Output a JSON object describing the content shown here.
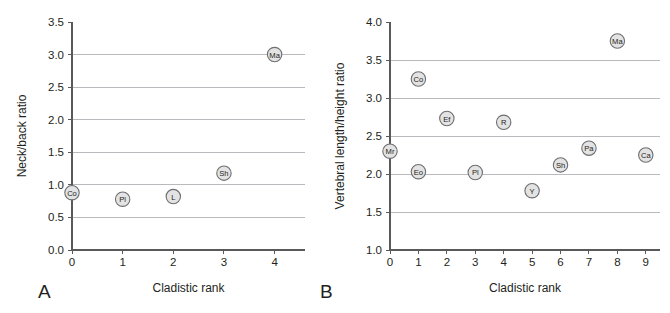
{
  "figure": {
    "background_color": "#ffffff",
    "marker_fill": "#e3e3e3",
    "marker_stroke": "#6d6e71",
    "grid_color": "#a7a9ac",
    "axis_color": "#58595b"
  },
  "panels": [
    {
      "id": "A",
      "label": "A",
      "chart_data": {
        "type": "scatter",
        "title": "",
        "xlabel": "Cladistic rank",
        "ylabel": "Neck/back ratio",
        "xlim": [
          0,
          4.6
        ],
        "ylim": [
          0.0,
          3.5
        ],
        "xticks": [
          "0",
          "1",
          "2",
          "3",
          "4"
        ],
        "xtick_values": [
          0,
          1,
          2,
          3,
          4
        ],
        "yticks": [
          "0.0",
          "0.5",
          "1.0",
          "1.5",
          "2.0",
          "2.5",
          "3.0",
          "3.5"
        ],
        "ytick_values": [
          0.0,
          0.5,
          1.0,
          1.5,
          2.0,
          2.5,
          3.0,
          3.5
        ],
        "grid": true,
        "gridlines_y": [
          0.5,
          1.0,
          1.5,
          2.0,
          2.5,
          3.0
        ],
        "legend": "none",
        "points": [
          {
            "label": "Co",
            "x": 0,
            "y": 0.88
          },
          {
            "label": "Pl",
            "x": 1,
            "y": 0.78
          },
          {
            "label": "L",
            "x": 2,
            "y": 0.82
          },
          {
            "label": "Sh",
            "x": 3,
            "y": 1.18
          },
          {
            "label": "Ma",
            "x": 4,
            "y": 3.0
          }
        ]
      }
    },
    {
      "id": "B",
      "label": "B",
      "chart_data": {
        "type": "scatter",
        "title": "",
        "xlabel": "Cladistic rank",
        "ylabel": "Vertebral length/height ratio",
        "xlim": [
          0,
          9.5
        ],
        "ylim": [
          1.0,
          4.0
        ],
        "xticks": [
          "0",
          "1",
          "2",
          "3",
          "4",
          "5",
          "6",
          "7",
          "8",
          "9"
        ],
        "xtick_values": [
          0,
          1,
          2,
          3,
          4,
          5,
          6,
          7,
          8,
          9
        ],
        "yticks": [
          "1.0",
          "1.5",
          "2.0",
          "2.5",
          "3.0",
          "3.5",
          "4.0"
        ],
        "ytick_values": [
          1.0,
          1.5,
          2.0,
          2.5,
          3.0,
          3.5,
          4.0
        ],
        "grid": true,
        "gridlines_y": [
          1.5,
          2.0,
          2.5,
          3.0,
          3.5
        ],
        "legend": "none",
        "points": [
          {
            "label": "Mr",
            "x": 0,
            "y": 2.3
          },
          {
            "label": "Co",
            "x": 1,
            "y": 3.25
          },
          {
            "label": "Eo",
            "x": 1,
            "y": 2.03
          },
          {
            "label": "Ef",
            "x": 2,
            "y": 2.73
          },
          {
            "label": "Pl",
            "x": 3,
            "y": 2.02
          },
          {
            "label": "R",
            "x": 4,
            "y": 2.68
          },
          {
            "label": "Y",
            "x": 5,
            "y": 1.78
          },
          {
            "label": "Sh",
            "x": 6,
            "y": 2.12
          },
          {
            "label": "Pa",
            "x": 7,
            "y": 2.34
          },
          {
            "label": "Ma",
            "x": 8,
            "y": 3.75
          },
          {
            "label": "Ca",
            "x": 9,
            "y": 2.25
          }
        ]
      }
    }
  ]
}
